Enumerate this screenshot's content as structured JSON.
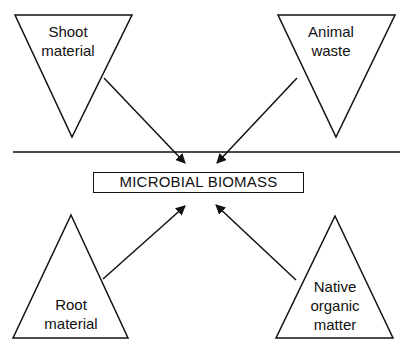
{
  "diagram": {
    "center": {
      "label": "MICROBIAL BIOMASS"
    },
    "sources": [
      {
        "id": "shoot",
        "label_lines": [
          "Shoot",
          "material"
        ],
        "shape": "inverted-triangle",
        "position": "top-left"
      },
      {
        "id": "animal",
        "label_lines": [
          "Animal",
          "waste"
        ],
        "shape": "inverted-triangle",
        "position": "top-right"
      },
      {
        "id": "root",
        "label_lines": [
          "Root",
          "material"
        ],
        "shape": "triangle",
        "position": "bottom-left"
      },
      {
        "id": "native",
        "label_lines": [
          "Native",
          "organic",
          "matter"
        ],
        "shape": "triangle",
        "position": "bottom-right"
      }
    ],
    "arrows": [
      {
        "from": "shoot",
        "to": "center"
      },
      {
        "from": "animal",
        "to": "center"
      },
      {
        "from": "root",
        "to": "center"
      },
      {
        "from": "native",
        "to": "center"
      }
    ],
    "divider": "horizontal line separating above-ground and below-ground inputs",
    "colors": {
      "stroke": "#111111",
      "background": "#ffffff"
    }
  }
}
